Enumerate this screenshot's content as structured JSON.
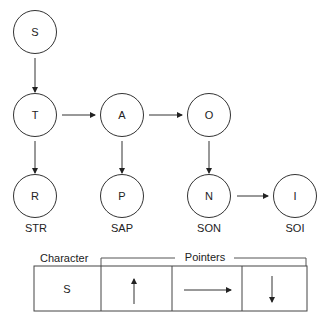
{
  "nodes": [
    {
      "id": "S",
      "label": "S",
      "cx": 35,
      "cy": 32
    },
    {
      "id": "T",
      "label": "T",
      "cx": 35,
      "cy": 115
    },
    {
      "id": "A",
      "label": "A",
      "cx": 122,
      "cy": 115
    },
    {
      "id": "O",
      "label": "O",
      "cx": 209,
      "cy": 115
    },
    {
      "id": "R",
      "label": "R",
      "cx": 35,
      "cy": 196,
      "word": "STR"
    },
    {
      "id": "P",
      "label": "P",
      "cx": 122,
      "cy": 196,
      "word": "SAP"
    },
    {
      "id": "N",
      "label": "N",
      "cx": 209,
      "cy": 196,
      "word": "SON"
    },
    {
      "id": "I",
      "label": "I",
      "cx": 295,
      "cy": 196,
      "word": "SOI"
    }
  ],
  "words": {
    "STR": "STR",
    "SAP": "SAP",
    "SON": "SON",
    "SOI": "SOI"
  },
  "table": {
    "character_header": "Character",
    "pointers_header": "Pointers",
    "character_value": "S"
  }
}
